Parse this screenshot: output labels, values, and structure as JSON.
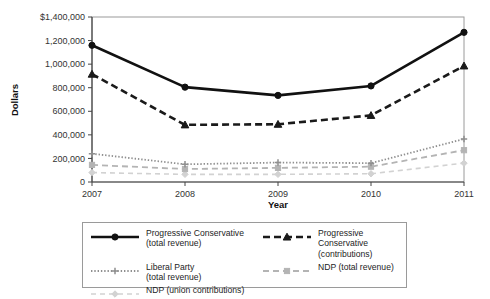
{
  "chart_data": {
    "type": "line",
    "title": "",
    "xlabel": "Year",
    "ylabel": "Dollars",
    "x": [
      2007,
      2008,
      2009,
      2010,
      2011
    ],
    "categories": [
      "2007",
      "2008",
      "2009",
      "2010",
      "2011"
    ],
    "xtick_labels": [
      "2007",
      "2008",
      "2009",
      "2010",
      "2011"
    ],
    "ytick_labels": [
      "$1,400,000",
      "1,200,000",
      "1,000,000",
      "800,000",
      "600,000",
      "400,000",
      "200,000",
      "0"
    ],
    "ytick_values": [
      1400000,
      1200000,
      1000000,
      800000,
      600000,
      400000,
      200000,
      0
    ],
    "ylim": [
      0,
      1400000
    ],
    "xlim": [
      2007,
      2011
    ],
    "grid": false,
    "legend_position": "below-center",
    "series": [
      {
        "name": "Progressive Conservative\n(total revenue)",
        "key": "pc-total-revenue",
        "values": [
          1160000,
          805000,
          735000,
          815000,
          1270000
        ],
        "color": "#111111",
        "style": "solid",
        "marker": "circle",
        "width": 2.6
      },
      {
        "name": "Progressive Conservative\n(contributions)",
        "key": "pc-contributions",
        "values": [
          915000,
          485000,
          490000,
          565000,
          985000
        ],
        "color": "#1a1a1a",
        "style": "dashed",
        "marker": "triangle",
        "width": 2.6
      },
      {
        "name": "Liberal Party\n(total revenue)",
        "key": "liberal-total-revenue",
        "values": [
          240000,
          150000,
          165000,
          160000,
          365000
        ],
        "color": "#8f8f8f",
        "style": "dotted",
        "marker": "plus",
        "width": 1.8
      },
      {
        "name": "NDP (total revenue)",
        "key": "ndp-total-revenue",
        "values": [
          145000,
          110000,
          120000,
          130000,
          270000
        ],
        "color": "#b4b4b4",
        "style": "dashdot",
        "marker": "square",
        "width": 1.8
      },
      {
        "name": "NDP (union contributions)",
        "key": "ndp-union-contributions",
        "values": [
          80000,
          65000,
          65000,
          70000,
          160000
        ],
        "color": "#d2d2d2",
        "style": "dashed-light",
        "marker": "diamond",
        "width": 1.6
      }
    ]
  },
  "axes": {
    "ylabel": "Dollars",
    "xlabel": "Year",
    "yticks": [
      "$1,400,000",
      "1,200,000",
      "1,000,000",
      "800,000",
      "600,000",
      "400,000",
      "200,000",
      "0"
    ],
    "xticks": [
      "2007",
      "2008",
      "2009",
      "2010",
      "2011"
    ]
  },
  "legend": {
    "entries": [
      {
        "label": "Progressive Conservative\n(total revenue)",
        "swatch": "solid-circle-black"
      },
      {
        "label": "Progressive Conservative\n(contributions)",
        "swatch": "dashed-triangle-black"
      },
      {
        "label": "Liberal Party\n(total revenue)",
        "swatch": "dotted-plus-gray"
      },
      {
        "label": "NDP (total revenue)",
        "swatch": "dashdot-square-lightgray"
      },
      {
        "label": "NDP (union contributions)",
        "swatch": "dashed-diamond-palegray"
      }
    ]
  }
}
